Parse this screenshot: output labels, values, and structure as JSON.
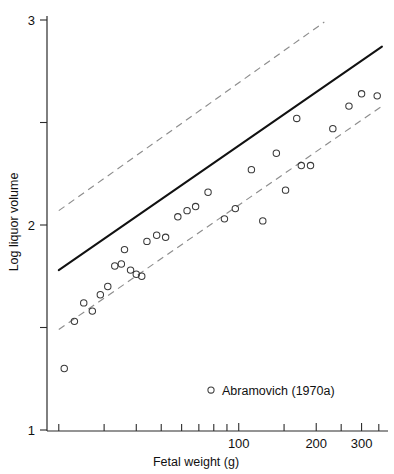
{
  "chart_data": {
    "type": "scatter",
    "title": "",
    "xlabel": "Fetal weight (g)",
    "ylabel": "Log liquor volume",
    "x_scale": "log",
    "y_scale": "linear",
    "xlim": [
      18,
      380
    ],
    "ylim": [
      1,
      3
    ],
    "grid": false,
    "x_major_ticks": [
      100,
      200,
      300
    ],
    "x_major_tick_labels": [
      "100",
      "200",
      "300"
    ],
    "x_minor_ticks": [
      20,
      30,
      40,
      50,
      60,
      70,
      80,
      90,
      150,
      250,
      350
    ],
    "y_ticks": [
      1,
      1.5,
      2,
      2.5,
      3
    ],
    "y_tick_labels": [
      "1",
      "",
      "2",
      "",
      "3"
    ],
    "legend": {
      "position": "bottom-center-inside",
      "entries": [
        {
          "marker": "open-circle",
          "label": "Abramovich (1970a)"
        }
      ]
    },
    "series": [
      {
        "name": "Abramovich (1970a)",
        "marker": "open-circle",
        "points": [
          {
            "x": 21,
            "y": 1.3
          },
          {
            "x": 23,
            "y": 1.53
          },
          {
            "x": 25,
            "y": 1.62
          },
          {
            "x": 27,
            "y": 1.58
          },
          {
            "x": 29,
            "y": 1.66
          },
          {
            "x": 31,
            "y": 1.7
          },
          {
            "x": 33,
            "y": 1.8
          },
          {
            "x": 35,
            "y": 1.81
          },
          {
            "x": 36,
            "y": 1.88
          },
          {
            "x": 38,
            "y": 1.78
          },
          {
            "x": 40,
            "y": 1.76
          },
          {
            "x": 42,
            "y": 1.75
          },
          {
            "x": 44,
            "y": 1.92
          },
          {
            "x": 48,
            "y": 1.95
          },
          {
            "x": 52,
            "y": 1.94
          },
          {
            "x": 58,
            "y": 2.04
          },
          {
            "x": 63,
            "y": 2.07
          },
          {
            "x": 68,
            "y": 2.09
          },
          {
            "x": 76,
            "y": 2.16
          },
          {
            "x": 88,
            "y": 2.03
          },
          {
            "x": 97,
            "y": 2.08
          },
          {
            "x": 112,
            "y": 2.27
          },
          {
            "x": 124,
            "y": 2.02
          },
          {
            "x": 140,
            "y": 2.35
          },
          {
            "x": 152,
            "y": 2.17
          },
          {
            "x": 168,
            "y": 2.52
          },
          {
            "x": 175,
            "y": 2.29
          },
          {
            "x": 190,
            "y": 2.29
          },
          {
            "x": 232,
            "y": 2.47
          },
          {
            "x": 268,
            "y": 2.58
          },
          {
            "x": 300,
            "y": 2.64
          },
          {
            "x": 345,
            "y": 2.63
          }
        ]
      }
    ],
    "fit_line": {
      "style": "solid",
      "label": "regression line",
      "endpoints": [
        {
          "x": 20,
          "y": 1.78
        },
        {
          "x": 360,
          "y": 2.87
        }
      ]
    },
    "confidence_bands": [
      {
        "name": "upper-limit",
        "style": "dashed",
        "endpoints": [
          {
            "x": 20,
            "y": 2.07
          },
          {
            "x": 215,
            "y": 2.99
          }
        ]
      },
      {
        "name": "lower-limit",
        "style": "dashed",
        "endpoints": [
          {
            "x": 20,
            "y": 1.49
          },
          {
            "x": 360,
            "y": 2.58
          }
        ]
      }
    ]
  }
}
